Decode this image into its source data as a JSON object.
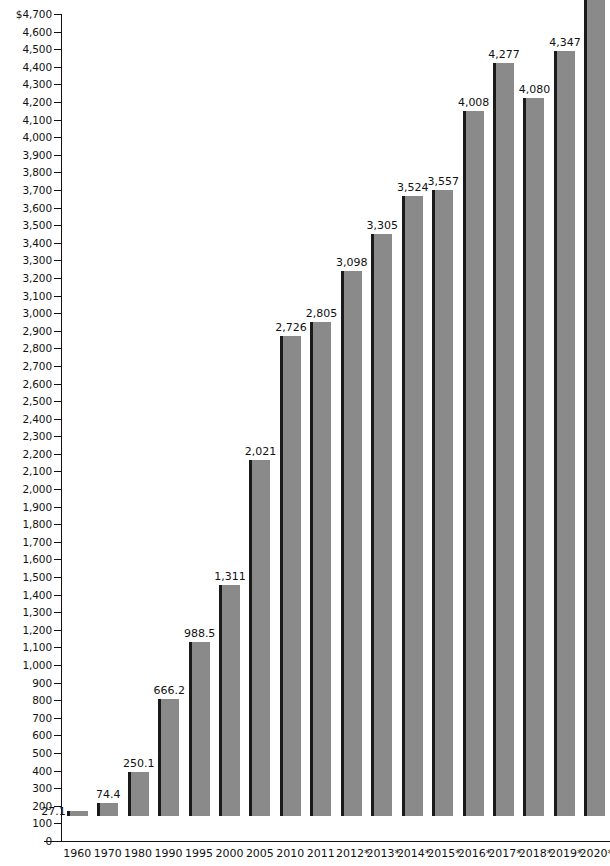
{
  "chart_data": {
    "type": "bar",
    "title": "",
    "subtitle": "",
    "xlabel": "",
    "ylabel": "",
    "categories": [
      "1960",
      "1970",
      "1980",
      "1990",
      "1995",
      "2000",
      "2005",
      "2010",
      "2011",
      "2012*",
      "2013*",
      "2014*",
      "2015*",
      "2016*",
      "2017*",
      "2018*",
      "2019*",
      "2020*"
    ],
    "values": [
      27.1,
      74.4,
      250.1,
      666.2,
      988.5,
      1311,
      2021,
      2726,
      2805,
      3098,
      3305,
      3524,
      3557,
      4008,
      4277,
      4080,
      4347,
      4638
    ],
    "value_labels": [
      "27.1",
      "74.4",
      "250.1",
      "666.2",
      "988.5",
      "1,311",
      "2,021",
      "2,726",
      "2,805",
      "3,098",
      "3,305",
      "3,524",
      "3,557",
      "4,008",
      "4,277",
      "4,080",
      "4,347",
      "4,638"
    ],
    "ylim": [
      0,
      4700
    ],
    "ytick_step": 100,
    "ytick_labels": [
      "$4,700",
      "4,600",
      "4,500",
      "4,400",
      "4,300",
      "4,200",
      "4,100",
      "4,000",
      "3,900",
      "3,800",
      "3,700",
      "3,600",
      "3,500",
      "3,400",
      "3,300",
      "3,200",
      "3,100",
      "3,000",
      "2,900",
      "2,800",
      "2,700",
      "2,600",
      "2,500",
      "2,400",
      "2,300",
      "2,200",
      "2,100",
      "2,000",
      "1,900",
      "1,800",
      "1,700",
      "1,600",
      "1,500",
      "1,400",
      "1,300",
      "1,200",
      "1,100",
      "1,000",
      "900",
      "800",
      "700",
      "600",
      "500",
      "400",
      "300",
      "200",
      "100",
      "0"
    ],
    "ytick_values": [
      4700,
      4600,
      4500,
      4400,
      4300,
      4200,
      4100,
      4000,
      3900,
      3800,
      3700,
      3600,
      3500,
      3400,
      3300,
      3200,
      3100,
      3000,
      2900,
      2800,
      2700,
      2600,
      2500,
      2400,
      2300,
      2200,
      2100,
      2000,
      1900,
      1800,
      1700,
      1600,
      1500,
      1400,
      1300,
      1200,
      1100,
      1000,
      900,
      800,
      700,
      600,
      500,
      400,
      300,
      200,
      100,
      0
    ],
    "grid": false,
    "legend": null,
    "series": [
      {
        "name": "value",
        "values": [
          27.1,
          74.4,
          250.1,
          666.2,
          988.5,
          1311,
          2021,
          2726,
          2805,
          3098,
          3305,
          3524,
          3557,
          4008,
          4277,
          4080,
          4347,
          4638
        ]
      }
    ],
    "colors": {
      "bar_fill": "#8a8a8a",
      "bar_edge": "#1a1a1a",
      "axis": "#111111",
      "background": "#ffffff",
      "text": "#111111"
    },
    "currency_symbol": "$",
    "footnote_marker": "*"
  }
}
